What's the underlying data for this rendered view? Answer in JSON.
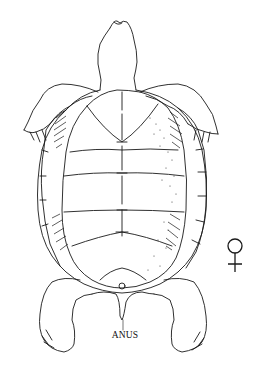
{
  "figure": {
    "labels": {
      "anus": "ANUS"
    },
    "sex_symbol": {
      "icon": "female-symbol",
      "glyph": "♀"
    },
    "colors": {
      "background": "#ffffff",
      "ink": "#1a1a1a"
    }
  }
}
